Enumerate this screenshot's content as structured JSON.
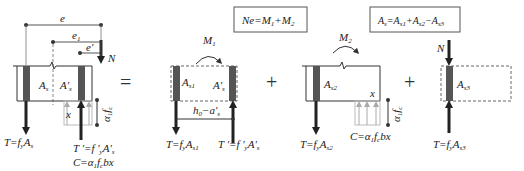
{
  "diagram": {
    "operators": [
      "=",
      "+",
      "+"
    ],
    "boxes": {
      "equilibrium": {
        "main": "Ne=M",
        "s1": "1",
        "mid": "+M",
        "s2": "2"
      },
      "area": {
        "a": "A",
        "s": "s",
        "eq": "=A",
        "s1": "s1",
        "p1": "+A",
        "s2": "s2",
        "m": "−A",
        "s3": "s3"
      }
    },
    "panel_total": {
      "dims": {
        "e": "e",
        "e1": "e",
        "e1_sub": "1",
        "eprime": "e'"
      },
      "load": "N",
      "areas": {
        "As": "A",
        "As_sub": "s",
        "Aps": "A'",
        "Aps_sub": "s"
      },
      "x": "x",
      "stress": "α",
      "stress_sub": "1",
      "stress_f": "f",
      "stress_f_sub": "c",
      "T": {
        "text": "T=f",
        "sub1": "y",
        "A": "A",
        "sub2": "s"
      },
      "Tp": {
        "text": "T '=f '",
        "sub1": "y",
        "A": "A'",
        "sub2": "s"
      },
      "C": {
        "text": "C=α",
        "sub1": "1",
        "f": "f",
        "sub2": "c",
        "tail": "bx"
      }
    },
    "panel_1": {
      "moment": "M",
      "moment_sub": "1",
      "areas": {
        "As1": "A",
        "As1_sub": "s1",
        "Aps": "A'",
        "Aps_sub": "s"
      },
      "lever": "h",
      "lever_sub": "0",
      "lever_tail": "−a'",
      "lever_tail_sub": "s",
      "T": {
        "text": "T=f",
        "sub1": "y",
        "A": "A",
        "sub2": "s1"
      },
      "Tp": {
        "text": "T '=f '",
        "sub1": "y",
        "A": "A'",
        "sub2": "s"
      }
    },
    "panel_2": {
      "moment": "M",
      "moment_sub": "2",
      "areas": {
        "As2": "A",
        "As2_sub": "s2"
      },
      "x": "x",
      "stress": "α",
      "stress_sub": "1",
      "stress_f": "f",
      "stress_f_sub": "c",
      "T": {
        "text": "T=f",
        "sub1": "y",
        "A": "A",
        "sub2": "s2"
      },
      "C": {
        "text": "C=α",
        "sub1": "1",
        "f": "f",
        "sub2": "c",
        "tail": "bx"
      }
    },
    "panel_3": {
      "load": "N",
      "areas": {
        "As3": "A",
        "As3_sub": "s3"
      },
      "T": {
        "text": "T=f",
        "sub1": "y",
        "A": "A",
        "sub2": "s3"
      }
    },
    "colors": {
      "line": "#333333",
      "steel": "#555555",
      "dashed": "#666666",
      "stress_block": "#bbbbbb",
      "stress_arrow": "#aaaaaa"
    }
  }
}
